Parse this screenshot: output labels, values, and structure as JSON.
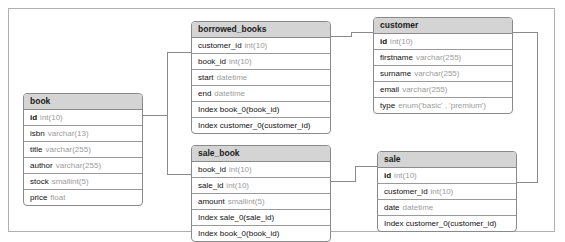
{
  "diagram": {
    "tables": [
      {
        "id": "book",
        "name": "book",
        "x": 22,
        "y": 92,
        "width": 120,
        "rows": [
          {
            "field": "id",
            "type": "int(10)",
            "pk": true
          },
          {
            "field": "isbn",
            "type": "varchar(13)",
            "pk": false
          },
          {
            "field": "title",
            "type": "varchar(255)",
            "pk": false
          },
          {
            "field": "author",
            "type": "varchar(255)",
            "pk": false
          },
          {
            "field": "stock",
            "type": "smallint(5)",
            "pk": false
          },
          {
            "field": "price",
            "type": "float",
            "pk": false
          }
        ]
      },
      {
        "id": "borrowed_books",
        "name": "borrowed_books",
        "x": 190,
        "y": 20,
        "width": 140,
        "rows": [
          {
            "field": "customer_id",
            "type": "int(10)",
            "pk": false
          },
          {
            "field": "book_id",
            "type": "int(10)",
            "pk": false
          },
          {
            "field": "start",
            "type": "datetime",
            "pk": false
          },
          {
            "field": "end",
            "type": "datetime",
            "pk": false
          },
          {
            "field": "Index book_0(book_id)",
            "type": "",
            "pk": false
          },
          {
            "field": "Index customer_0(customer_id)",
            "type": "",
            "pk": false
          }
        ]
      },
      {
        "id": "customer",
        "name": "customer",
        "x": 372,
        "y": 16,
        "width": 140,
        "rows": [
          {
            "field": "id",
            "type": "int(10)",
            "pk": true
          },
          {
            "field": "firstname",
            "type": "varchar(255)",
            "pk": false
          },
          {
            "field": "surname",
            "type": "varchar(255)",
            "pk": false
          },
          {
            "field": "email",
            "type": "varchar(255)",
            "pk": false
          },
          {
            "field": "type",
            "type": "enum('basic' , 'premium')",
            "pk": false
          }
        ]
      },
      {
        "id": "sale_book",
        "name": "sale_book",
        "x": 190,
        "y": 144,
        "width": 140,
        "rows": [
          {
            "field": "book_id",
            "type": "int(10)",
            "pk": false
          },
          {
            "field": "sale_id",
            "type": "int(10)",
            "pk": false
          },
          {
            "field": "amount",
            "type": "smallint(5)",
            "pk": false
          },
          {
            "field": "Index sale_0(sale_id)",
            "type": "",
            "pk": false
          },
          {
            "field": "Index book_0(book_id)",
            "type": "",
            "pk": false
          }
        ]
      },
      {
        "id": "sale",
        "name": "sale",
        "x": 376,
        "y": 150,
        "width": 140,
        "rows": [
          {
            "field": "id",
            "type": "int(10)",
            "pk": true
          },
          {
            "field": "customer_id",
            "type": "int(10)",
            "pk": false
          },
          {
            "field": "date",
            "type": "datetime",
            "pk": false
          },
          {
            "field": "Index customer_0(customer_id)",
            "type": "",
            "pk": false
          }
        ]
      }
    ],
    "relations": [
      {
        "id": "book-borrowed_books",
        "from": "book.id",
        "to": "borrowed_books.book_id"
      },
      {
        "id": "book-sale_book",
        "from": "book.id",
        "to": "sale_book.book_id"
      },
      {
        "id": "borrowed_books-customer",
        "from": "borrowed_books.customer_id",
        "to": "customer.id"
      },
      {
        "id": "customer-sale",
        "from": "customer.id",
        "to": "sale.customer_id"
      },
      {
        "id": "sale_book-sale",
        "from": "sale_book.sale_id",
        "to": "sale.id"
      }
    ]
  },
  "colors": {
    "header_fill": "#d4d4d4",
    "border": "#8a8a8a",
    "connector": "#8a8a8a",
    "field_name": "#101010",
    "field_type": "#9b9b9b",
    "frame": "#b0b0b0"
  }
}
